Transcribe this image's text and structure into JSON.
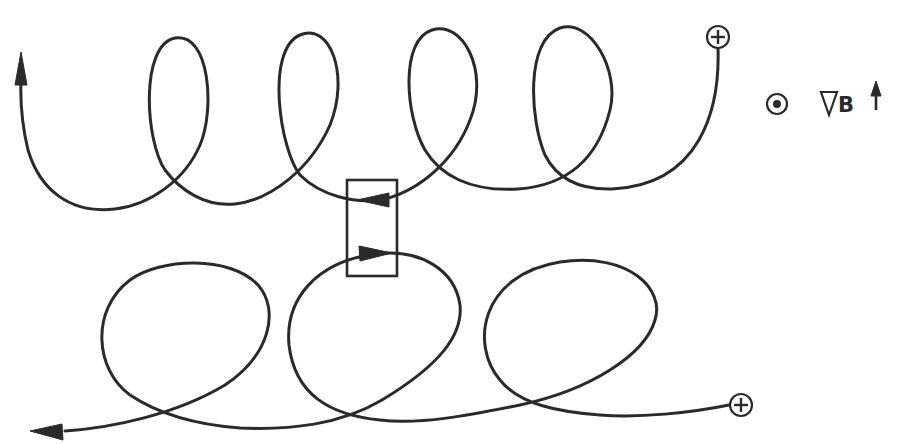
{
  "diagram": {
    "colors": {
      "stroke": "#2a2a2a",
      "background": "#ffffff"
    },
    "legend": {
      "field_symbol": "dot-in-circle (B out of page)",
      "gradient_label": "B",
      "gradient_symbol": "∇",
      "gradient_direction": "up"
    },
    "trajectories": [
      {
        "id": "upper",
        "start_charge": "+",
        "start_position": "upper-right",
        "drift_direction": "left",
        "loop_count": 4,
        "loop_shape": "tall narrow loops",
        "end": "arrow pointing up at left"
      },
      {
        "id": "lower",
        "start_charge": "+",
        "start_position": "lower-right",
        "drift_direction": "left",
        "loop_count": 3,
        "loop_shape": "wide round loops",
        "end": "arrow pointing left at bottom-left"
      }
    ],
    "highlight_box": {
      "description": "rectangle highlighting opposing velocity arrows between the two trajectories",
      "arrows": [
        "left (upper)",
        "right (lower)"
      ]
    }
  }
}
